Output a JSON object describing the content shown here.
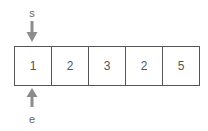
{
  "diagram": {
    "start_pointer": {
      "label": "s",
      "index": 0,
      "direction": "down",
      "color": "#8c8c8c"
    },
    "end_pointer": {
      "label": "e",
      "index": 0,
      "direction": "up",
      "color": "#8c8c8c"
    },
    "array": {
      "cells": [
        {
          "value": "1"
        },
        {
          "value": "2"
        },
        {
          "value": "3"
        },
        {
          "value": "2"
        },
        {
          "value": "5"
        }
      ]
    }
  }
}
